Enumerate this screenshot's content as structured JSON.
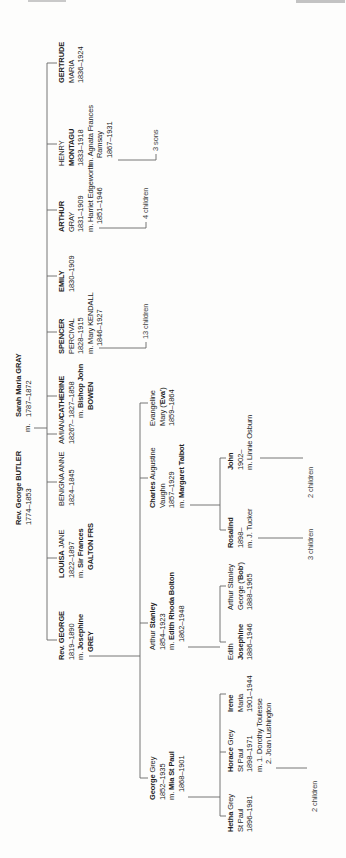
{
  "colors": {
    "text": "#222222",
    "line": "#666666",
    "muted": "#444444"
  },
  "tree": {
    "root_marriage_label": "m.",
    "people": [
      {
        "id": "butler",
        "lines": [
          [
            "",
            "Rev. George BUTLER",
            ""
          ],
          [
            "1774–1853",
            "",
            ""
          ]
        ]
      },
      {
        "id": "gray",
        "lines": [
          [
            "",
            "Sarah Maria GRAY",
            ""
          ],
          [
            "1787–1872",
            "",
            ""
          ]
        ]
      },
      {
        "id": "george2",
        "lines": [
          [
            "",
            "Rev. GEORGE",
            ""
          ],
          [
            "1819–1890",
            "",
            ""
          ],
          [
            "m. ",
            "Josephine",
            ""
          ],
          [
            "",
            "GREY",
            ""
          ]
        ]
      },
      {
        "id": "louisa",
        "lines": [
          [
            "",
            "LOUISA",
            " JANE"
          ],
          [
            "1822–1897",
            "",
            ""
          ],
          [
            "m. ",
            "Sir Frances",
            ""
          ],
          [
            "",
            "GALTON FRS",
            ""
          ]
        ]
      },
      {
        "id": "benigna",
        "lines": [
          [
            "BENIGNA ANNE",
            "",
            ""
          ],
          [
            "1824–1845",
            "",
            ""
          ]
        ]
      },
      {
        "id": "amiana",
        "lines": [
          [
            "AMIANA",
            "",
            ""
          ],
          [
            "1826?–",
            "",
            ""
          ]
        ]
      },
      {
        "id": "catherine",
        "lines": [
          [
            "",
            "CATHERINE",
            ""
          ],
          [
            "1827–1858",
            "",
            ""
          ],
          [
            "m. ",
            "Bishop John",
            ""
          ],
          [
            "",
            "BOWEN",
            ""
          ]
        ]
      },
      {
        "id": "spencer",
        "lines": [
          [
            "",
            "SPENCER",
            ""
          ],
          [
            "PERCIVAL",
            "",
            ""
          ],
          [
            "1828–1915",
            "",
            ""
          ],
          [
            "m. Mary KENDALL",
            "",
            ""
          ],
          [
            "1846–1927",
            "",
            ""
          ]
        ]
      },
      {
        "id": "emily",
        "lines": [
          [
            "",
            "EMILY",
            ""
          ],
          [
            "1830–1909",
            "",
            ""
          ]
        ]
      },
      {
        "id": "arthur",
        "lines": [
          [
            "",
            "ARTHUR",
            ""
          ],
          [
            "GRAY",
            "",
            ""
          ],
          [
            "1831–1909",
            "",
            ""
          ],
          [
            "m. Harriet Edgeworth",
            "",
            ""
          ],
          [
            "1851–1946",
            "",
            ""
          ]
        ]
      },
      {
        "id": "henry",
        "lines": [
          [
            "HENRY",
            "",
            ""
          ],
          [
            "",
            "MONTAGU",
            ""
          ],
          [
            "1833–1918",
            "",
            ""
          ],
          [
            "m. Agnata Frances",
            "",
            ""
          ],
          [
            "Ramsay",
            "",
            ""
          ],
          [
            "1867–1931",
            "",
            ""
          ]
        ]
      },
      {
        "id": "gertrude",
        "lines": [
          [
            "",
            "GERTRUDE",
            ""
          ],
          [
            "MARIA",
            "",
            ""
          ],
          [
            "1836–1924",
            "",
            ""
          ]
        ]
      },
      {
        "id": "george3",
        "lines": [
          [
            "",
            "George",
            " Grey"
          ],
          [
            "1852–1935",
            "",
            ""
          ],
          [
            "m. ",
            "Mia St Paul",
            ""
          ],
          [
            "1868–1901",
            "",
            ""
          ]
        ]
      },
      {
        "id": "arthur3",
        "lines": [
          [
            "Arthur ",
            "Stanley",
            ""
          ],
          [
            "1854–1923",
            "",
            ""
          ],
          [
            "m. ",
            "Edith Rhoda Bolton",
            ""
          ],
          [
            "1862–1948",
            "",
            ""
          ]
        ]
      },
      {
        "id": "charles",
        "lines": [
          [
            "",
            "Charles",
            " Augustine"
          ],
          [
            "Vaughn",
            "",
            ""
          ],
          [
            "1857–1929",
            "",
            ""
          ],
          [
            "m. ",
            "Margaret Talbot",
            ""
          ]
        ]
      },
      {
        "id": "evangeline",
        "lines": [
          [
            "Evangeline",
            "",
            ""
          ],
          [
            "Mary ('",
            "Eva",
            "')"
          ],
          [
            "1859–1864",
            "",
            ""
          ]
        ]
      },
      {
        "id": "hetha",
        "lines": [
          [
            "",
            "Hetha",
            " Grey"
          ],
          [
            "St Paul",
            "",
            ""
          ],
          [
            "1896–1981",
            "",
            ""
          ]
        ]
      },
      {
        "id": "horace",
        "lines": [
          [
            "",
            "Horace",
            " Grey"
          ],
          [
            "St Paul",
            "",
            ""
          ],
          [
            "1898–1971",
            "",
            ""
          ],
          [
            "m. 1. Dorothy Toulesse",
            "",
            ""
          ],
          [
            "2. Joan Lushington",
            "",
            ""
          ]
        ]
      },
      {
        "id": "irene",
        "lines": [
          [
            "",
            "Irene",
            ""
          ],
          [
            "Maria",
            "",
            ""
          ],
          [
            "1901–1944",
            "",
            ""
          ]
        ]
      },
      {
        "id": "edithj",
        "lines": [
          [
            "Edith",
            "",
            ""
          ],
          [
            "",
            "Josephine",
            ""
          ],
          [
            "1886–1946",
            "",
            ""
          ]
        ]
      },
      {
        "id": "bob",
        "lines": [
          [
            "Arthur Stanley",
            "",
            ""
          ],
          [
            "George ('",
            "Bob",
            "')"
          ],
          [
            "1888–1965",
            "",
            ""
          ]
        ]
      },
      {
        "id": "rosalind",
        "lines": [
          [
            "",
            "Rosalind",
            ""
          ],
          [
            "1898–",
            "",
            ""
          ],
          [
            "m. J. Tucker",
            "",
            ""
          ]
        ]
      },
      {
        "id": "john",
        "lines": [
          [
            "",
            "John",
            ""
          ],
          [
            "1902–",
            "",
            ""
          ],
          [
            "m. Linnie Osburn",
            "",
            ""
          ]
        ]
      }
    ],
    "annotations": [
      {
        "id": "children13",
        "text": "13 children"
      },
      {
        "id": "children4",
        "text": "4 children"
      },
      {
        "id": "sons3",
        "text": "3 sons"
      },
      {
        "id": "children2b",
        "text": "2 children"
      },
      {
        "id": "children3",
        "text": "3 children"
      },
      {
        "id": "children2a",
        "text": "2 children"
      }
    ]
  }
}
